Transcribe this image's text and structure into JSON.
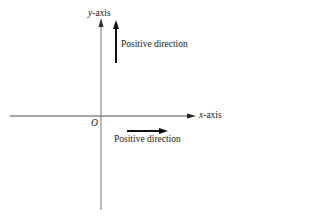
{
  "diagram": {
    "type": "coordinate-axes",
    "y_axis": {
      "var": "y",
      "suffix": "-axis"
    },
    "x_axis": {
      "var": "x",
      "suffix": "-axis"
    },
    "origin_label": "O",
    "y_positive_label": "Positive direction",
    "x_positive_label": "Positive direction",
    "colors": {
      "axis": "#8a8a8a",
      "arrow": "#111111",
      "text": "#1a1a1a"
    }
  }
}
